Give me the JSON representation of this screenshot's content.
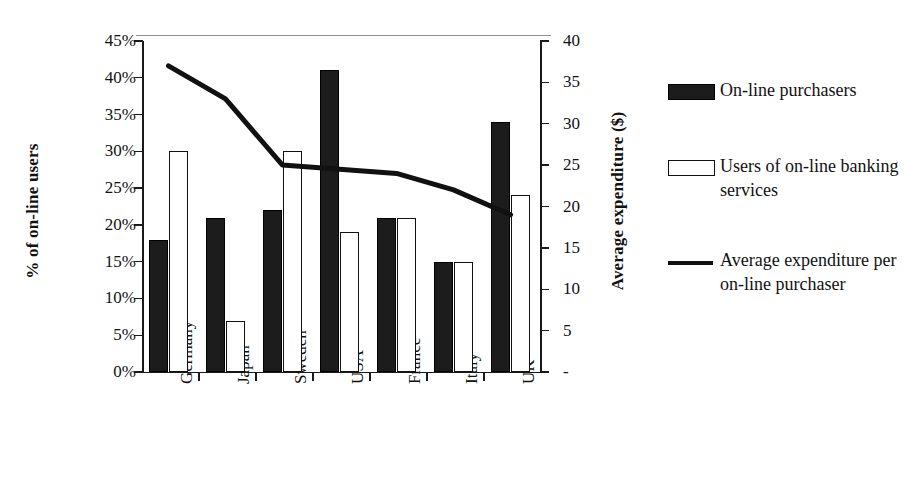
{
  "chart_data": {
    "type": "bar",
    "title": "",
    "subtitle": "",
    "categories": [
      "Germany",
      "Japan",
      "Sweden",
      "USA",
      "France",
      "Italy",
      "UK"
    ],
    "series": [
      {
        "name": "On-line purchasers",
        "kind": "bar",
        "axis": "left",
        "unit": "%",
        "color": "#1c1c1c",
        "values": [
          18,
          21,
          22,
          41,
          21,
          15,
          34
        ]
      },
      {
        "name": "Users of on-line banking services",
        "kind": "bar",
        "axis": "left",
        "unit": "%",
        "color": "#ffffff",
        "values": [
          30,
          7,
          30,
          19,
          21,
          15,
          24
        ]
      },
      {
        "name": "Average expenditure per on-line purchaser",
        "kind": "line",
        "axis": "right",
        "unit": "$",
        "color": "#111111",
        "values": [
          37,
          33,
          25,
          24.5,
          24,
          22,
          19
        ]
      }
    ],
    "xlabel": "",
    "ylabel": "% of on-line users",
    "y2label": "Average expenditure ($)",
    "ylim": [
      0,
      45
    ],
    "y2lim": [
      0,
      40
    ],
    "yticks": [
      "0%",
      "5%",
      "10%",
      "15%",
      "20%",
      "25%",
      "30%",
      "35%",
      "40%",
      "45%"
    ],
    "y2ticks": [
      "-",
      "5",
      "10",
      "15",
      "20",
      "25",
      "30",
      "35",
      "40"
    ],
    "grid": false,
    "legend_position": "right"
  },
  "axes": {
    "left": {
      "title": "% of on-line users",
      "ticks": [
        "45%",
        "40%",
        "35%",
        "30%",
        "25%",
        "20%",
        "15%",
        "10%",
        "5%",
        "0%"
      ]
    },
    "right": {
      "title": "Average expenditure ($)",
      "ticks": [
        "40",
        "35",
        "30",
        "25",
        "20",
        "15",
        "10",
        "5",
        "-"
      ]
    },
    "categories": [
      "Germany",
      "Japan",
      "Sweden",
      "USA",
      "France",
      "Italy",
      "UK"
    ]
  },
  "legend": {
    "items": [
      {
        "label": "On-line purchasers",
        "swatch": "filled-black-rect"
      },
      {
        "label": "Users of on-line banking services",
        "swatch": "outlined-white-rect"
      },
      {
        "label": "Average expenditure per on-line purchaser",
        "swatch": "solid-black-line"
      }
    ]
  },
  "colors": {
    "series_dark": "#1c1c1c",
    "series_light": "#ffffff",
    "line": "#111111",
    "axis": "#1a1a1a",
    "background": "#ffffff"
  }
}
